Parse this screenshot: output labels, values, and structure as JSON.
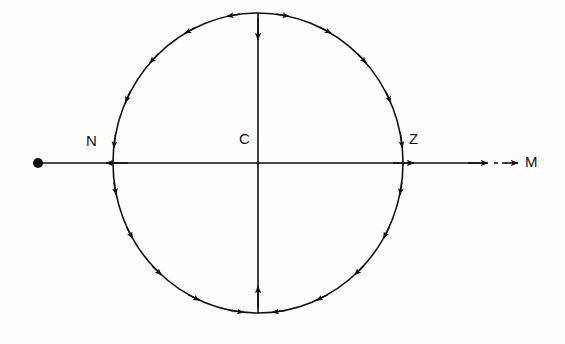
{
  "figure": {
    "title": "",
    "kind": "vector-field-circle-diagram",
    "background_color": "#fefefe",
    "stroke_color": "#111111",
    "canvas": {
      "width": 565,
      "height": 344
    }
  },
  "labels": {
    "left_point": "N",
    "center_point": "C",
    "right_point": "Z",
    "axis_end": "M"
  },
  "geometry": {
    "center": {
      "x": 258,
      "y": 163
    },
    "radius_x": 145,
    "radius_y": 150,
    "axis_start_x": 37,
    "axis_solid_end_x": 487,
    "dash_start_x": 492,
    "dash_end_x": 516,
    "origin_dot_radius": 5
  },
  "chart_data": {
    "type": "scatter",
    "title": "",
    "xlabel": "",
    "ylabel": "",
    "points": [
      {
        "name": "N",
        "x": 113,
        "y": 163
      },
      {
        "name": "C",
        "x": 258,
        "y": 163
      },
      {
        "name": "Z",
        "x": 403,
        "y": 163
      },
      {
        "name": "M",
        "x": 530,
        "y": 163
      }
    ],
    "circle_arrow_angles_deg": [
      100,
      118,
      136,
      154,
      172,
      190,
      208,
      226,
      244,
      262,
      80,
      62,
      44,
      26,
      8,
      350,
      332,
      314,
      296,
      278
    ],
    "axis_arrow_directions": [
      "left",
      "right",
      "right",
      "right"
    ],
    "vertical_arrow_directions": [
      "down",
      "up"
    ]
  }
}
